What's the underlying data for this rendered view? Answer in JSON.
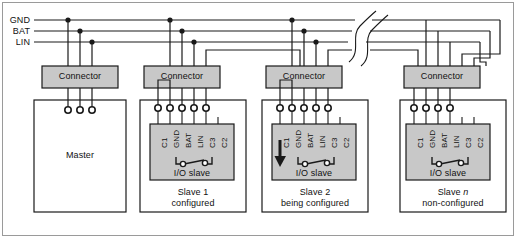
{
  "diagram": {
    "bus_labels": [
      {
        "name": "GND",
        "text": "GND",
        "y": 20
      },
      {
        "name": "BAT",
        "text": "BAT",
        "y": 31
      },
      {
        "name": "LIN",
        "text": "LIN",
        "y": 42
      }
    ],
    "connector_label": "Connector",
    "io_slave_label": "I/O slave",
    "master_label": "Master",
    "pin_labels": [
      "C1",
      "GND",
      "BAT",
      "LIN",
      "C3",
      "C2"
    ],
    "nodes": [
      {
        "id": "master",
        "kind": "master",
        "body_label": "Master",
        "connector_label": "Connector",
        "connector_pins": 3,
        "caption_line1": "",
        "caption_line2": ""
      },
      {
        "id": "slave1",
        "kind": "slave",
        "inner_label": "I/O slave",
        "connector_label": "Connector",
        "connector_pins": 5,
        "pin_labels": [
          "C1",
          "GND",
          "BAT",
          "LIN",
          "C3",
          "C2"
        ],
        "connected_pins": 5,
        "has_config_arrow": false,
        "caption_line1": "Slave 1",
        "caption_line2": "configured"
      },
      {
        "id": "slave2",
        "kind": "slave",
        "inner_label": "I/O slave",
        "connector_label": "Connector",
        "connector_pins": 5,
        "pin_labels": [
          "C1",
          "GND",
          "BAT",
          "LIN",
          "C3",
          "C2"
        ],
        "connected_pins": 5,
        "has_config_arrow": true,
        "caption_line1": "Slave 2",
        "caption_line2": "being configured"
      },
      {
        "id": "slaven",
        "kind": "slave",
        "inner_label": "I/O slave",
        "connector_label": "Connector",
        "connector_pins": 4,
        "pin_labels": [
          "C1",
          "GND",
          "BAT",
          "LIN",
          "C3",
          "C2"
        ],
        "connected_pins": 4,
        "has_config_arrow": false,
        "caption_line1": "Slave n",
        "caption_line1_italic_tail": "n",
        "caption_line2": "non-configured"
      }
    ],
    "break_symbol": "bus-continuation-break",
    "colors": {
      "line": "#1a1a1a",
      "box_fill": "#ffffff",
      "gray_fill": "#c8c8c8",
      "frame": "#9a9a9a",
      "text": "#111111"
    }
  }
}
